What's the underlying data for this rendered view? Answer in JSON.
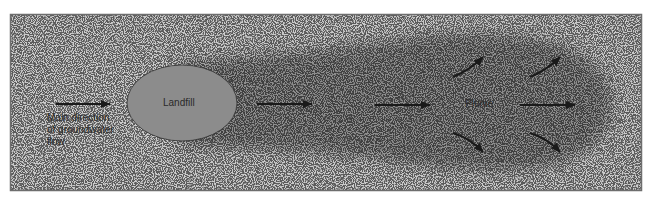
{
  "diagram": {
    "labels": {
      "flow_line1": "Main direction",
      "flow_line2": "of groundwater",
      "flow_line3": "flow",
      "landfill": "Landfill",
      "plume": "Plume"
    },
    "colors": {
      "ground": "#c9c9c9",
      "plume": "#8f8f8f",
      "landfill": "#8c8c8c",
      "frame": "#6e6e6e",
      "arrow": "#1a1a1a"
    }
  }
}
